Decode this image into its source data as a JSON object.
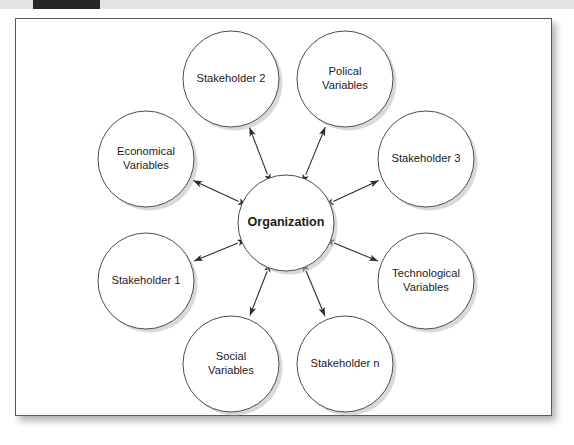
{
  "banner": {
    "dark_strip": "",
    "light_strip": "",
    "dark_color": "#272727",
    "light_color": "#e3e3e3"
  },
  "figure": {
    "frame_border_color": "#5a5a5a",
    "background_color": "#ffffff"
  },
  "diagram": {
    "type": "hub-and-spoke",
    "node_fill": "#ffffff",
    "node_stroke": "#4d4d4d",
    "link_color": "#2b2b2b",
    "link_style": "bidirectional-arrow",
    "center": {
      "label": "Organization",
      "cx": 270,
      "cy": 204,
      "r": 48
    },
    "satellites": [
      {
        "id": "stakeholder-2",
        "label": "Stakeholder 2",
        "lines": [
          "Stakeholder 2"
        ],
        "cx": 215,
        "cy": 60,
        "r": 48,
        "angle": 249
      },
      {
        "id": "polical-variables",
        "label": "Polical Variables",
        "lines": [
          "Polical",
          "Variables"
        ],
        "cx": 329,
        "cy": 60,
        "r": 48,
        "angle": 291
      },
      {
        "id": "stakeholder-3",
        "label": "Stakeholder 3",
        "lines": [
          "Stakeholder 3"
        ],
        "cx": 410,
        "cy": 140,
        "r": 48,
        "angle": 333
      },
      {
        "id": "technological-variables",
        "label": "Technological Variables",
        "lines": [
          "Technological",
          "Variables"
        ],
        "cx": 410,
        "cy": 262,
        "r": 48,
        "angle": 27
      },
      {
        "id": "stakeholder-n",
        "label": "Stakeholder n",
        "lines": [
          "Stakeholder n"
        ],
        "cx": 329,
        "cy": 345,
        "r": 48,
        "angle": 69
      },
      {
        "id": "social-variables",
        "label": "Social Variables",
        "lines": [
          "Social",
          "Variables"
        ],
        "cx": 215,
        "cy": 345,
        "r": 48,
        "angle": 111
      },
      {
        "id": "stakeholder-1",
        "label": "Stakeholder 1",
        "lines": [
          "Stakeholder 1"
        ],
        "cx": 130,
        "cy": 262,
        "r": 48,
        "angle": 153
      },
      {
        "id": "economical-variables",
        "label": "Economical Variables",
        "lines": [
          "Economical",
          "Variables"
        ],
        "cx": 130,
        "cy": 140,
        "r": 48,
        "angle": 195
      }
    ]
  }
}
